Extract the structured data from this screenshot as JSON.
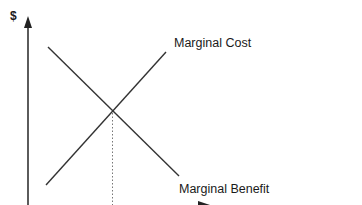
{
  "diagram": {
    "y_axis_label": "$",
    "curves": [
      {
        "name": "Marginal Cost",
        "label": "Marginal Cost",
        "from": [
          46,
          185
        ],
        "to": [
          166,
          52
        ]
      },
      {
        "name": "Marginal Benefit",
        "label": "Marginal Benefit",
        "from": [
          48,
          47
        ],
        "to": [
          179,
          176
        ]
      }
    ],
    "intersection": [
      112,
      112
    ],
    "colors": {
      "line": "#333333",
      "axis": "#333333",
      "dotted": "#666666",
      "background": "#ffffff"
    }
  }
}
